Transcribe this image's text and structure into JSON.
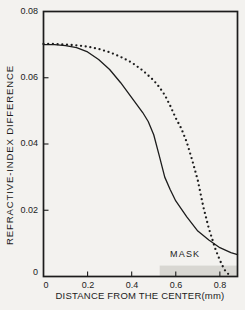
{
  "figure": {
    "background": "#f3f2ef",
    "ink_color": "#1c1c1c",
    "mask_fill": "#d8d7d2"
  },
  "chart_data": {
    "type": "line",
    "title": "",
    "xlabel": "DISTANCE FROM THE CENTER(mm)",
    "ylabel": "REFRACTIVE-INDEX DIFFERENCE",
    "xlim": [
      0,
      0.88
    ],
    "ylim": [
      0,
      0.08
    ],
    "grid": false,
    "legend": "none",
    "x_ticks": {
      "values": [
        0,
        0.2,
        0.4,
        0.6,
        0.8
      ],
      "labels": [
        "0",
        "0.2",
        "0.4",
        "0.6",
        "0.8"
      ]
    },
    "y_ticks": {
      "values": [
        0,
        0.02,
        0.04,
        0.06,
        0.08
      ],
      "labels": [
        "0",
        "0.02",
        "0.04",
        "0.06",
        "0.08"
      ]
    },
    "series": [
      {
        "name": "solid-index-profile",
        "style": "solid",
        "color": "#1c1c1c",
        "points": [
          [
            0.0,
            0.07
          ],
          [
            0.05,
            0.07
          ],
          [
            0.1,
            0.0697
          ],
          [
            0.15,
            0.0691
          ],
          [
            0.2,
            0.0678
          ],
          [
            0.25,
            0.0655
          ],
          [
            0.3,
            0.0625
          ],
          [
            0.35,
            0.0585
          ],
          [
            0.4,
            0.054
          ],
          [
            0.45,
            0.0495
          ],
          [
            0.475,
            0.0468
          ],
          [
            0.5,
            0.0428
          ],
          [
            0.525,
            0.0365
          ],
          [
            0.55,
            0.03
          ],
          [
            0.575,
            0.0262
          ],
          [
            0.6,
            0.0228
          ],
          [
            0.65,
            0.018
          ],
          [
            0.7,
            0.0137
          ],
          [
            0.75,
            0.011
          ],
          [
            0.8,
            0.0087
          ],
          [
            0.85,
            0.0072
          ],
          [
            0.88,
            0.0066
          ]
        ]
      },
      {
        "name": "dotted-index-profile",
        "style": "dotted",
        "color": "#1c1c1c",
        "points": [
          [
            0.0,
            0.0702
          ],
          [
            0.05,
            0.0702
          ],
          [
            0.1,
            0.07
          ],
          [
            0.15,
            0.0698
          ],
          [
            0.2,
            0.0694
          ],
          [
            0.25,
            0.0687
          ],
          [
            0.3,
            0.0677
          ],
          [
            0.35,
            0.0663
          ],
          [
            0.4,
            0.0646
          ],
          [
            0.45,
            0.0622
          ],
          [
            0.5,
            0.0592
          ],
          [
            0.525,
            0.0572
          ],
          [
            0.55,
            0.0548
          ],
          [
            0.575,
            0.0515
          ],
          [
            0.6,
            0.0478
          ],
          [
            0.625,
            0.0447
          ],
          [
            0.65,
            0.0405
          ],
          [
            0.675,
            0.035
          ],
          [
            0.7,
            0.029
          ],
          [
            0.725,
            0.021
          ],
          [
            0.75,
            0.0145
          ],
          [
            0.78,
            0.0082
          ],
          [
            0.8,
            0.0049
          ],
          [
            0.82,
            0.0021
          ],
          [
            0.84,
            0.0006
          ],
          [
            0.85,
            0.0
          ]
        ]
      }
    ],
    "annotations": [
      {
        "type": "shaded-region",
        "label": "MASK",
        "x_range": [
          0.527,
          0.88
        ],
        "y_range": [
          0,
          0.0033
        ],
        "fill": "#d8d7d2"
      }
    ]
  }
}
